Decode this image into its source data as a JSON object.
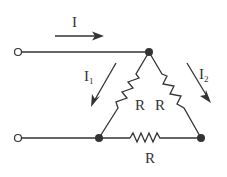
{
  "diagram": {
    "type": "circuit",
    "labels": {
      "current_total": "I",
      "current_1": "I",
      "current_1_sub": "1",
      "current_2": "I",
      "current_2_sub": "2",
      "resistor_left": "R",
      "resistor_right": "R",
      "resistor_bottom": "R"
    },
    "colors": {
      "line": "#333333",
      "background": "#ffffff"
    }
  }
}
